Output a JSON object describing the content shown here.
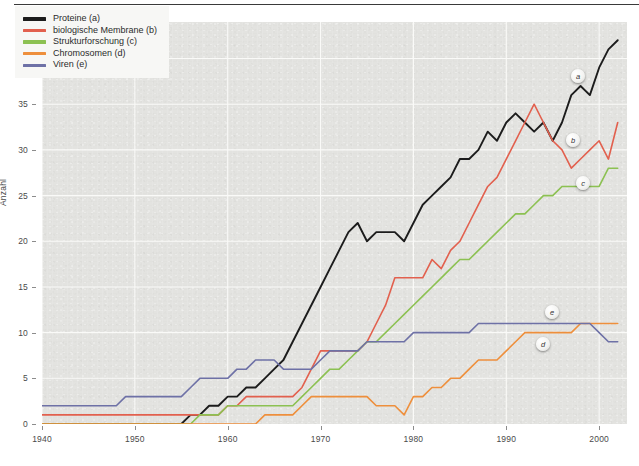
{
  "chart_data": {
    "type": "line",
    "title": "",
    "xlabel": "",
    "ylabel": "Anzahl",
    "xlim": [
      1940,
      2003
    ],
    "ylim": [
      0,
      44
    ],
    "xticks": [
      1940,
      1950,
      1960,
      1970,
      1980,
      1990,
      2000
    ],
    "yticks": [
      0,
      5,
      10,
      15,
      20,
      25,
      30,
      35,
      40
    ],
    "grid": true,
    "legend_position": "top-left",
    "x": [
      1940,
      1941,
      1942,
      1943,
      1944,
      1945,
      1946,
      1947,
      1948,
      1949,
      1950,
      1951,
      1952,
      1953,
      1954,
      1955,
      1956,
      1957,
      1958,
      1959,
      1960,
      1961,
      1962,
      1963,
      1964,
      1965,
      1966,
      1967,
      1968,
      1969,
      1970,
      1971,
      1972,
      1973,
      1974,
      1975,
      1976,
      1977,
      1978,
      1979,
      1980,
      1981,
      1982,
      1983,
      1984,
      1985,
      1986,
      1987,
      1988,
      1989,
      1990,
      1991,
      1992,
      1993,
      1994,
      1995,
      1996,
      1997,
      1998,
      1999,
      2000,
      2001,
      2002
    ],
    "series": [
      {
        "name": "Proteine (a)",
        "key": "a",
        "color": "#1c1c1c",
        "width": 1.9,
        "values": [
          0,
          0,
          0,
          0,
          0,
          0,
          0,
          0,
          0,
          0,
          0,
          0,
          0,
          0,
          0,
          0,
          1,
          1,
          2,
          2,
          3,
          3,
          4,
          4,
          5,
          6,
          7,
          9,
          11,
          13,
          15,
          17,
          19,
          21,
          22,
          20,
          21,
          21,
          21,
          20,
          22,
          24,
          25,
          26,
          27,
          29,
          29,
          30,
          32,
          31,
          33,
          34,
          33,
          32,
          33,
          31,
          33,
          36,
          37,
          36,
          39,
          41,
          42
        ]
      },
      {
        "name": "biologische Membrane (b)",
        "key": "b",
        "color": "#e2604e",
        "width": 1.6,
        "values": [
          1,
          1,
          1,
          1,
          1,
          1,
          1,
          1,
          1,
          1,
          1,
          1,
          1,
          1,
          1,
          1,
          1,
          1,
          1,
          1,
          2,
          2,
          3,
          3,
          3,
          3,
          3,
          3,
          4,
          6,
          8,
          8,
          8,
          8,
          8,
          9,
          11,
          13,
          16,
          16,
          16,
          16,
          18,
          17,
          19,
          20,
          22,
          24,
          26,
          27,
          29,
          31,
          33,
          35,
          33,
          31,
          30,
          28,
          29,
          30,
          31,
          29,
          33
        ]
      },
      {
        "name": "Strukturforschung (c)",
        "key": "c",
        "color": "#8cc152",
        "width": 1.6,
        "values": [
          0,
          0,
          0,
          0,
          0,
          0,
          0,
          0,
          0,
          0,
          0,
          0,
          0,
          0,
          0,
          0,
          0,
          1,
          1,
          1,
          2,
          2,
          2,
          2,
          2,
          2,
          2,
          2,
          3,
          4,
          5,
          6,
          6,
          7,
          8,
          9,
          9,
          10,
          11,
          12,
          13,
          14,
          15,
          16,
          17,
          18,
          18,
          19,
          20,
          21,
          22,
          23,
          23,
          24,
          25,
          25,
          26,
          26,
          26,
          26,
          26,
          28,
          28
        ]
      },
      {
        "name": "Chromosomen (d)",
        "key": "d",
        "color": "#ee8f3c",
        "width": 1.6,
        "values": [
          0,
          0,
          0,
          0,
          0,
          0,
          0,
          0,
          0,
          0,
          0,
          0,
          0,
          0,
          0,
          0,
          0,
          0,
          0,
          0,
          0,
          0,
          0,
          0,
          1,
          1,
          1,
          1,
          2,
          3,
          3,
          3,
          3,
          3,
          3,
          3,
          2,
          2,
          2,
          1,
          3,
          3,
          4,
          4,
          5,
          5,
          6,
          7,
          7,
          7,
          8,
          9,
          10,
          10,
          10,
          10,
          10,
          10,
          11,
          11,
          11,
          11,
          11
        ]
      },
      {
        "name": "Viren (e)",
        "key": "e",
        "color": "#6e71a6",
        "width": 1.6,
        "values": [
          2,
          2,
          2,
          2,
          2,
          2,
          2,
          2,
          2,
          3,
          3,
          3,
          3,
          3,
          3,
          3,
          4,
          5,
          5,
          5,
          5,
          6,
          6,
          7,
          7,
          7,
          6,
          6,
          6,
          6,
          7,
          8,
          8,
          8,
          8,
          9,
          9,
          9,
          9,
          9,
          10,
          10,
          10,
          10,
          10,
          10,
          10,
          11,
          11,
          11,
          11,
          11,
          11,
          11,
          11,
          11,
          11,
          11,
          11,
          11,
          10,
          9,
          9
        ]
      }
    ]
  },
  "legend": {
    "items": [
      {
        "label": "Proteine (a)",
        "color": "#1c1c1c"
      },
      {
        "label": "biologische Membrane (b)",
        "color": "#e2604e"
      },
      {
        "label": "Strukturforschung (c)",
        "color": "#8cc152"
      },
      {
        "label": "Chromosomen (d)",
        "color": "#ee8f3c"
      },
      {
        "label": "Viren (e)",
        "color": "#6e71a6"
      }
    ]
  },
  "axes": {
    "ylabel": "Anzahl",
    "yticks": [
      "0",
      "5",
      "10",
      "15",
      "20",
      "25",
      "30",
      "35",
      "40"
    ],
    "xticks": [
      "1940",
      "1950",
      "1960",
      "1970",
      "1980",
      "1990",
      "2000"
    ]
  },
  "callouts": [
    {
      "key": "a",
      "label": "a",
      "x": 578,
      "y": 76
    },
    {
      "key": "b",
      "label": "b",
      "x": 573,
      "y": 140
    },
    {
      "key": "c",
      "label": "c",
      "x": 583,
      "y": 183
    },
    {
      "key": "e",
      "label": "e",
      "x": 552,
      "y": 312
    },
    {
      "key": "d",
      "label": "d",
      "x": 543,
      "y": 344
    }
  ]
}
